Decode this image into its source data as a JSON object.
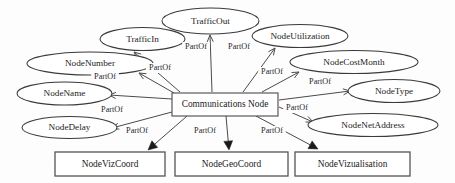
{
  "diagram": {
    "type": "entity-relationship-partof-diagram",
    "relationship_label": "PartOf",
    "colors": {
      "background": "#fdfdfd",
      "node_fill": "#ffffff",
      "ellipse_stroke": "#3a3a3a",
      "rect_stroke": "#555555",
      "edge_stroke": "#4b4b4b",
      "text": "#1c1c1c",
      "arrow_solid_fill": "#1a1a1a"
    },
    "center": {
      "id": "communications-node",
      "label": "Communications Node",
      "shape": "rectangle",
      "x": 172,
      "y": 93,
      "w": 106,
      "h": 23
    },
    "ellipse_nodes": [
      {
        "id": "traffic-out",
        "label": "TrafficOut",
        "shape": "ellipse",
        "cx": 210.5,
        "cy": 21.0,
        "rx": 48.5,
        "ry": 13.0
      },
      {
        "id": "traffic-in",
        "label": "TrafficIn",
        "shape": "ellipse",
        "cx": 142.5,
        "cy": 39.0,
        "rx": 42.5,
        "ry": 11.5
      },
      {
        "id": "node-utilization",
        "label": "NodeUtilization",
        "shape": "ellipse",
        "cx": 300.0,
        "cy": 36.0,
        "rx": 48.0,
        "ry": 11.5
      },
      {
        "id": "node-number",
        "label": "NodeNumber",
        "shape": "ellipse",
        "cx": 90.0,
        "cy": 63.5,
        "rx": 63.0,
        "ry": 11.5
      },
      {
        "id": "node-cost-month",
        "label": "NodeCostMonth",
        "shape": "ellipse",
        "cx": 354.0,
        "cy": 62.0,
        "rx": 64.0,
        "ry": 11.5
      },
      {
        "id": "node-name",
        "label": "NodeName",
        "shape": "ellipse",
        "cx": 64.5,
        "cy": 93.5,
        "rx": 47.5,
        "ry": 11.5
      },
      {
        "id": "node-type",
        "label": "NodeType",
        "shape": "ellipse",
        "cx": 394.0,
        "cy": 91.0,
        "rx": 46.0,
        "ry": 11.5
      },
      {
        "id": "node-delay",
        "label": "NodeDelay",
        "shape": "ellipse",
        "cx": 69.5,
        "cy": 127.5,
        "rx": 47.5,
        "ry": 11.0
      },
      {
        "id": "node-net-address",
        "label": "NodeNetAddress",
        "shape": "ellipse",
        "cx": 373.0,
        "cy": 125.0,
        "rx": 65.0,
        "ry": 11.5
      }
    ],
    "rect_nodes": [
      {
        "id": "node-viz-coord",
        "label": "NodeVizCoord",
        "shape": "rectangle",
        "x": 55,
        "y": 152,
        "w": 110,
        "h": 24
      },
      {
        "id": "node-geo-coord",
        "label": "NodeGeoCoord",
        "shape": "rectangle",
        "x": 175,
        "y": 152,
        "w": 113,
        "h": 24
      },
      {
        "id": "node-vizualisation",
        "label": "NodeVizualisation",
        "shape": "rectangle",
        "x": 295,
        "y": 152,
        "w": 115,
        "h": 24
      }
    ],
    "edges": [
      {
        "id": "edge-traffic-in",
        "from": "communications-node",
        "to": "traffic-in",
        "label": "PartOf",
        "label_x": 160,
        "label_y": 68,
        "arrow": "open",
        "x1": 180,
        "y1": 92,
        "x2": 134,
        "y2": 52
      },
      {
        "id": "edge-traffic-out",
        "from": "communications-node",
        "to": "traffic-out",
        "label": "PartOf",
        "label_x": 196,
        "label_y": 47,
        "arrow": "open",
        "x1": 212,
        "y1": 92,
        "x2": 210,
        "y2": 35
      },
      {
        "id": "edge-node-utilization",
        "from": "communications-node",
        "to": "node-utilization",
        "label": "PartOf",
        "label_x": 239,
        "label_y": 47,
        "arrow": "open",
        "x1": 243,
        "y1": 92,
        "x2": 275,
        "y2": 48
      },
      {
        "id": "edge-node-number",
        "from": "communications-node",
        "to": "node-number",
        "label": "PartOf",
        "label_x": 160,
        "label_y": 68,
        "arrow": "open",
        "x1": 174,
        "y1": 93,
        "x2": 139,
        "y2": 73
      },
      {
        "id": "edge-node-name",
        "from": "communications-node",
        "to": "node-name",
        "label": "PartOf",
        "label_x": 105,
        "label_y": 77,
        "arrow": "open",
        "x1": 172,
        "y1": 99,
        "x2": 109,
        "y2": 95
      },
      {
        "id": "edge-node-delay",
        "from": "communications-node",
        "to": "node-delay",
        "label": "PartOf",
        "label_x": 112,
        "label_y": 110,
        "arrow": "open",
        "x1": 172,
        "y1": 112,
        "x2": 112,
        "y2": 128
      },
      {
        "id": "edge-node-cost-month",
        "from": "communications-node",
        "to": "node-cost-month",
        "label": "PartOf",
        "label_x": 272,
        "label_y": 72,
        "arrow": "open",
        "x1": 262,
        "y1": 92,
        "x2": 299,
        "y2": 72
      },
      {
        "id": "edge-node-type",
        "from": "communications-node",
        "to": "node-type",
        "label": "PartOf",
        "label_x": 320,
        "label_y": 82,
        "arrow": "open",
        "x1": 279,
        "y1": 100,
        "x2": 350,
        "y2": 91
      },
      {
        "id": "edge-node-net-address",
        "from": "communications-node",
        "to": "node-net-address",
        "label": "PartOf",
        "label_x": 297,
        "label_y": 108,
        "arrow": "open",
        "x1": 279,
        "y1": 107,
        "x2": 313,
        "y2": 122
      },
      {
        "id": "edge-node-viz-coord",
        "from": "communications-node",
        "to": "node-viz-coord",
        "label": "PartOf",
        "label_x": 137,
        "label_y": 131,
        "arrow": "solid",
        "x1": 187,
        "y1": 116,
        "x2": 148,
        "y2": 150
      },
      {
        "id": "edge-node-geo-coord",
        "from": "communications-node",
        "to": "node-geo-coord",
        "label": "PartOf",
        "label_x": 205,
        "label_y": 131,
        "arrow": "solid",
        "x1": 226,
        "y1": 116,
        "x2": 229,
        "y2": 150
      },
      {
        "id": "edge-node-vizualisation",
        "from": "communications-node",
        "to": "node-vizualisation",
        "label": "PartOf",
        "label_x": 272,
        "label_y": 131,
        "arrow": "solid",
        "x1": 256,
        "y1": 116,
        "x2": 318,
        "y2": 149
      }
    ]
  }
}
